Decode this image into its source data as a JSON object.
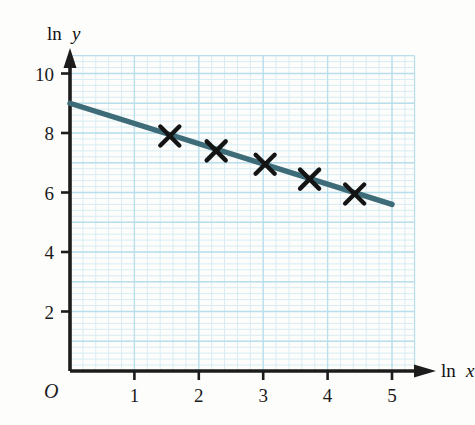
{
  "chart_data": {
    "type": "scatter",
    "title": "",
    "subtitle": "",
    "xlabel": "ln x",
    "ylabel": "ln y",
    "origin_label": "O",
    "xlim": [
      0,
      5.35
    ],
    "ylim": [
      0,
      10.6
    ],
    "xticks": [
      1,
      2,
      3,
      4,
      5
    ],
    "xtick_labels": [
      "1",
      "2",
      "3",
      "4",
      "5"
    ],
    "yticks": [
      2,
      4,
      6,
      8,
      10
    ],
    "ytick_labels": [
      "2",
      "4",
      "6",
      "8",
      "10"
    ],
    "grid": true,
    "grid_minor_step": 0.2,
    "grid_major_step": 1.0,
    "legend": null,
    "series": [
      {
        "name": "data points",
        "type": "scatter",
        "marker": "x-cross",
        "color": "#141414",
        "points": [
          {
            "x": 1.55,
            "y": 7.9
          },
          {
            "x": 2.27,
            "y": 7.4
          },
          {
            "x": 3.03,
            "y": 6.95
          },
          {
            "x": 3.72,
            "y": 6.45
          },
          {
            "x": 4.42,
            "y": 5.95
          }
        ]
      },
      {
        "name": "line of best fit",
        "type": "line",
        "color": "#3d6b78",
        "intercept": 9.0,
        "slope": -0.68,
        "x_start": 0.0,
        "y_start": 9.0,
        "x_end": 5.0,
        "y_end": 5.6
      }
    ],
    "colors": {
      "line": "#3d6b78",
      "marker": "#141414",
      "axis": "#1c1c1c",
      "grid_minor": "#d8ecf3",
      "grid_major": "#b9dfec",
      "background": "#fdfdfb"
    }
  },
  "axes": {
    "y_axis_name": "y-axis",
    "x_axis_name": "x-axis",
    "y_label_prefix": "ln",
    "y_label_var": "y",
    "x_label_prefix": "ln",
    "x_label_var": "x"
  }
}
